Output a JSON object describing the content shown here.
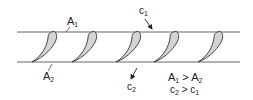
{
  "diagram": {
    "type": "turbine blade cascade",
    "blade_count": 5,
    "blade_x": [
      52,
      90,
      135,
      172,
      217
    ],
    "labels": {
      "a1": {
        "main": "A",
        "sub": "1"
      },
      "a2": {
        "main": "A",
        "sub": "2"
      },
      "c1": {
        "main": "c",
        "sub": "1"
      },
      "c2": {
        "main": "c",
        "sub": "2"
      }
    },
    "relations": [
      {
        "lhs": "A",
        "lhs_sub": "1",
        "op": " > ",
        "rhs": "A",
        "rhs_sub": "2"
      },
      {
        "lhs": "c",
        "lhs_sub": "2",
        "op": " > ",
        "rhs": "c",
        "rhs_sub": "1"
      }
    ],
    "colors": {
      "line": "#555555",
      "blade_fill": "#d4d4d4",
      "blade_stroke": "#333333"
    }
  }
}
